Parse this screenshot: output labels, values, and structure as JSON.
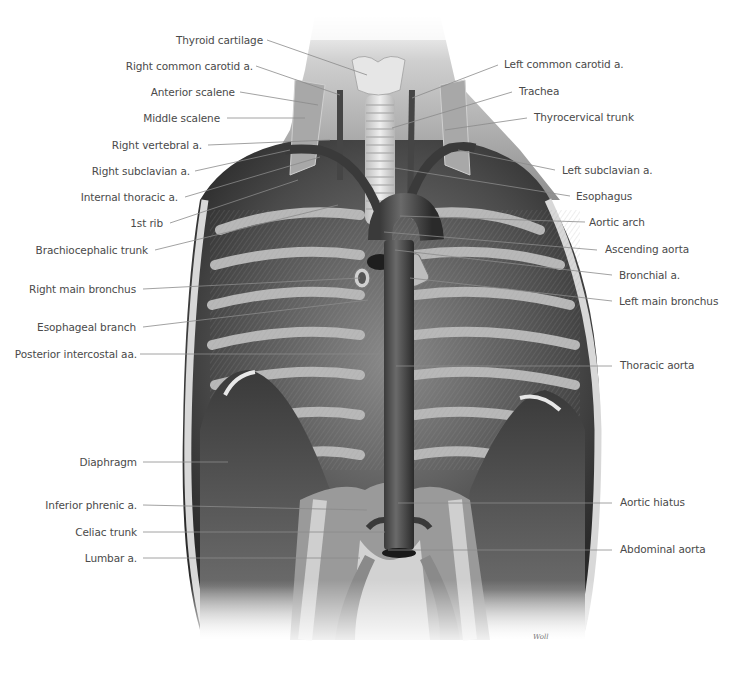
{
  "figure": {
    "signature": "Woll",
    "colors": {
      "background": "#ffffff",
      "label_text": "#4a4a4a",
      "leader_line": "#8a8a8a",
      "tissue_dark": "#2e2e2e",
      "tissue_mid": "#7a7a7a",
      "tissue_light": "#d4d4d4"
    }
  },
  "labels_left": [
    {
      "id": "thyroid-cartilage",
      "text": "Thyroid cartilage"
    },
    {
      "id": "right-common-carotid",
      "text": "Right common carotid a."
    },
    {
      "id": "anterior-scalene",
      "text": "Anterior scalene"
    },
    {
      "id": "middle-scalene",
      "text": "Middle scalene"
    },
    {
      "id": "right-vertebral",
      "text": "Right vertebral a."
    },
    {
      "id": "right-subclavian",
      "text": "Right subclavian a."
    },
    {
      "id": "internal-thoracic",
      "text": "Internal thoracic a."
    },
    {
      "id": "first-rib",
      "text": "1st rib"
    },
    {
      "id": "brachiocephalic-trunk",
      "text": "Brachiocephalic trunk"
    },
    {
      "id": "right-main-bronchus",
      "text": "Right main bronchus"
    },
    {
      "id": "esophageal-branch",
      "text": "Esophageal branch"
    },
    {
      "id": "posterior-intercostal",
      "text": "Posterior intercostal aa."
    },
    {
      "id": "diaphragm",
      "text": "Diaphragm"
    },
    {
      "id": "inferior-phrenic",
      "text": "Inferior phrenic a."
    },
    {
      "id": "celiac-trunk",
      "text": "Celiac trunk"
    },
    {
      "id": "lumbar",
      "text": "Lumbar a."
    }
  ],
  "labels_right": [
    {
      "id": "left-common-carotid",
      "text": "Left common carotid a."
    },
    {
      "id": "trachea",
      "text": "Trachea"
    },
    {
      "id": "thyrocervical-trunk",
      "text": "Thyrocervical trunk"
    },
    {
      "id": "left-subclavian",
      "text": "Left subclavian a."
    },
    {
      "id": "esophagus",
      "text": "Esophagus"
    },
    {
      "id": "aortic-arch",
      "text": "Aortic arch"
    },
    {
      "id": "ascending-aorta",
      "text": "Ascending aorta"
    },
    {
      "id": "bronchial",
      "text": "Bronchial a."
    },
    {
      "id": "left-main-bronchus",
      "text": "Left main bronchus"
    },
    {
      "id": "thoracic-aorta",
      "text": "Thoracic aorta"
    },
    {
      "id": "aortic-hiatus",
      "text": "Aortic hiatus"
    },
    {
      "id": "abdominal-aorta",
      "text": "Abdominal aorta"
    }
  ]
}
